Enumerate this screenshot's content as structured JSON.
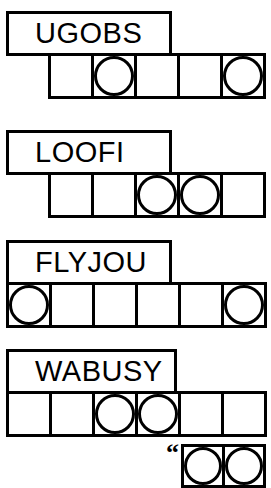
{
  "puzzle": {
    "type": "word-scramble-puzzle",
    "ink_color": "#000000",
    "paper_color": "#ffffff",
    "rows": [
      {
        "id": "row-1",
        "clue": "UGOBS",
        "cell_count": 5,
        "circled_positions": [
          2,
          5
        ],
        "clue_box": {
          "x": 6,
          "y": 11,
          "width": 166,
          "height": 45
        },
        "cell_strip": {
          "x": 48,
          "y": 53,
          "cell_size": 46
        }
      },
      {
        "id": "row-2",
        "clue": "LOOFI",
        "cell_count": 5,
        "circled_positions": [
          3,
          4
        ],
        "clue_box": {
          "x": 6,
          "y": 130,
          "width": 166,
          "height": 45
        },
        "cell_strip": {
          "x": 48,
          "y": 172,
          "cell_size": 46
        }
      },
      {
        "id": "row-3",
        "clue": "FLYJOU",
        "cell_count": 6,
        "circled_positions": [
          1,
          6
        ],
        "clue_box": {
          "x": 6,
          "y": 240,
          "width": 166,
          "height": 45
        },
        "cell_strip": {
          "x": 6,
          "y": 282,
          "cell_size": 46
        }
      },
      {
        "id": "row-4",
        "clue": "WABUSY",
        "cell_count": 6,
        "circled_positions": [
          3,
          4
        ],
        "clue_box": {
          "x": 6,
          "y": 349,
          "width": 171,
          "height": 45
        },
        "cell_strip": {
          "x": 6,
          "y": 391,
          "cell_size": 46
        }
      }
    ],
    "teaser": {
      "id": "answer-teaser",
      "quote_glyph": "“",
      "cell_count": 2,
      "circled_positions": [
        1,
        2
      ],
      "x": 166,
      "y": 446,
      "cell_size": 44
    }
  }
}
